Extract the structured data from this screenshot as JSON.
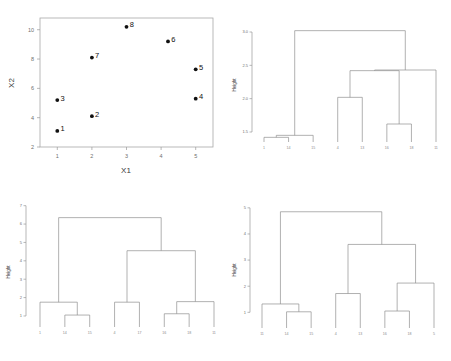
{
  "figure": {
    "panels": [
      "scatter",
      "dendrogram-complete",
      "dendrogram-average",
      "dendrogram-single"
    ],
    "background": "#ffffff",
    "line_color": "#8f8f8f",
    "point_color": "#111111"
  },
  "chart_data": [
    {
      "type": "scatter",
      "panel": "top-left",
      "title": "",
      "xlabel": "X1",
      "ylabel": "X2",
      "xlim": [
        0.5,
        5.5
      ],
      "ylim": [
        2,
        10.8
      ],
      "xticks": [
        "1",
        "2",
        "3",
        "4",
        "5"
      ],
      "xtick_values": [
        1,
        2,
        3,
        4,
        5
      ],
      "yticks": [
        "2",
        "4",
        "6",
        "8",
        "10"
      ],
      "ytick_values": [
        2,
        4,
        6,
        8,
        10
      ],
      "grid": false,
      "legend": "none",
      "point_labels": [
        "1",
        "2",
        "3",
        "4",
        "5",
        "6",
        "7",
        "8"
      ],
      "x": [
        1.0,
        2.0,
        1.0,
        5.0,
        5.0,
        4.2,
        2.0,
        3.0
      ],
      "y": [
        3.1,
        4.1,
        5.2,
        5.3,
        7.3,
        9.2,
        8.1,
        10.2
      ]
    },
    {
      "type": "dendrogram",
      "panel": "top-right",
      "title": "",
      "ylabel": "Height",
      "xlabel": "",
      "yticks": [
        "1.5",
        "2.0",
        "2.5",
        "3.0"
      ],
      "ytick_values": [
        1.5,
        2.0,
        2.5,
        3.0
      ],
      "ylim": [
        1.35,
        3.15
      ],
      "grid": false,
      "legend": "none",
      "leaf_order": [
        "1",
        "14",
        "15",
        "4",
        "13",
        "16",
        "18",
        "11"
      ],
      "merges": [
        {
          "left": "4",
          "right": "13",
          "height": 2.02
        },
        {
          "left": "16",
          "right": "18",
          "height": 1.62
        },
        {
          "left": "1",
          "right": "14",
          "height": 1.42
        },
        {
          "left": "n3",
          "right": "15",
          "height": 1.45
        },
        {
          "left": "n1",
          "right": "n2",
          "height": 2.42
        },
        {
          "left": "n5",
          "right": "11",
          "height": 2.43
        },
        {
          "left": "n4",
          "right": "n6",
          "height": 3.02
        }
      ]
    },
    {
      "type": "dendrogram",
      "panel": "bottom-left",
      "title": "",
      "ylabel": "Height",
      "xlabel": "",
      "yticks": [
        "1",
        "2",
        "3",
        "4",
        "5",
        "6",
        "7"
      ],
      "ytick_values": [
        1,
        2,
        3,
        4,
        5,
        6,
        7
      ],
      "ylim": [
        0.4,
        7.2
      ],
      "grid": false,
      "legend": "none",
      "leaf_order": [
        "1",
        "14",
        "15",
        "4",
        "17",
        "16",
        "18",
        "11"
      ],
      "merges": [
        {
          "left": "14",
          "right": "15",
          "height": 1.05
        },
        {
          "left": "1",
          "right": "n1",
          "height": 1.75
        },
        {
          "left": "4",
          "right": "17",
          "height": 1.75
        },
        {
          "left": "16",
          "right": "18",
          "height": 1.12
        },
        {
          "left": "n4",
          "right": "11",
          "height": 1.78
        },
        {
          "left": "n3",
          "right": "n5",
          "height": 4.55
        },
        {
          "left": "n2",
          "right": "n6",
          "height": 6.35
        }
      ]
    },
    {
      "type": "dendrogram",
      "panel": "bottom-right",
      "title": "",
      "ylabel": "Height",
      "xlabel": "",
      "yticks": [
        "1",
        "2",
        "3",
        "4",
        "5"
      ],
      "ytick_values": [
        1,
        2,
        3,
        4,
        5
      ],
      "ylim": [
        0.4,
        5.3
      ],
      "grid": false,
      "legend": "none",
      "leaf_order": [
        "11",
        "14",
        "15",
        "4",
        "13",
        "16",
        "18",
        "5"
      ],
      "merges": [
        {
          "left": "14",
          "right": "15",
          "height": 1.02
        },
        {
          "left": "11",
          "right": "n1",
          "height": 1.32
        },
        {
          "left": "4",
          "right": "13",
          "height": 1.72
        },
        {
          "left": "16",
          "right": "18",
          "height": 1.05
        },
        {
          "left": "n4",
          "right": "5",
          "height": 2.12
        },
        {
          "left": "n3",
          "right": "n5",
          "height": 3.6
        },
        {
          "left": "n2",
          "right": "n6",
          "height": 4.85
        }
      ]
    }
  ],
  "scatter": {
    "xlabel": "X1",
    "ylabel": "X2",
    "xticks": [
      "1",
      "2",
      "3",
      "4",
      "5"
    ],
    "yticks": [
      "2",
      "4",
      "6",
      "8",
      "10"
    ],
    "points": [
      {
        "label": "1",
        "x": 1.0,
        "y": 3.1
      },
      {
        "label": "2",
        "x": 2.0,
        "y": 4.1
      },
      {
        "label": "3",
        "x": 1.0,
        "y": 5.2
      },
      {
        "label": "4",
        "x": 5.0,
        "y": 5.3
      },
      {
        "label": "5",
        "x": 5.0,
        "y": 7.3
      },
      {
        "label": "6",
        "x": 4.2,
        "y": 9.2
      },
      {
        "label": "7",
        "x": 2.0,
        "y": 8.1
      },
      {
        "label": "8",
        "x": 3.0,
        "y": 10.2
      }
    ]
  },
  "dendro_tr": {
    "ylabel": "Height",
    "yticks": [
      "1.5",
      "2.0",
      "2.5",
      "3.0"
    ],
    "leaves": [
      "1",
      "14",
      "15",
      "4",
      "13",
      "16",
      "18",
      "11"
    ]
  },
  "dendro_bl": {
    "ylabel": "Height",
    "yticks": [
      "1",
      "2",
      "3",
      "4",
      "5",
      "6",
      "7"
    ],
    "leaves": [
      "1",
      "14",
      "15",
      "4",
      "17",
      "16",
      "18",
      "11"
    ]
  },
  "dendro_br": {
    "ylabel": "Height",
    "yticks": [
      "1",
      "2",
      "3",
      "4",
      "5"
    ],
    "leaves": [
      "11",
      "14",
      "15",
      "4",
      "13",
      "16",
      "18",
      "5"
    ]
  }
}
